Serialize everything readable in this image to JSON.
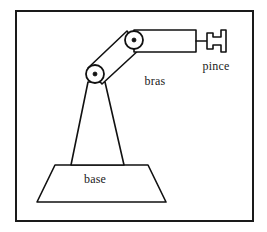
{
  "figure": {
    "background_color": "#ffffff",
    "stroke_color": "#111111",
    "frame": {
      "name": "figure-border",
      "x": 16,
      "y": 11,
      "width": 237,
      "height": 210,
      "stroke_color": "#1a1a1a",
      "stroke_width": 2
    }
  },
  "labels": {
    "base": "base",
    "arm": "bras",
    "gripper": "pince"
  },
  "label_positions": {
    "base": {
      "x": 95,
      "y": 183
    },
    "arm": {
      "x": 155,
      "y": 85
    },
    "gripper": {
      "x": 216,
      "y": 70
    }
  },
  "parts": {
    "base": {
      "name": "robot-base",
      "shape": "trapezoid",
      "points": "55,165 148,165 166,202 37,202"
    },
    "column": {
      "name": "robot-column",
      "shape": "tapered-column",
      "points": "88,82 105,82 124,165 71,165"
    },
    "upper_arm": {
      "name": "robot-upper-arm",
      "shape": "parallelogram-link",
      "points": "88,68 127,31 141,48 102,84"
    },
    "forearm": {
      "name": "robot-forearm",
      "shape": "rectangle-link",
      "points": "134,30 196,30 196,52 134,52"
    },
    "gripper_stem": {
      "name": "gripper-stem",
      "shape": "line",
      "x1": 196,
      "y1": 41,
      "x2": 207,
      "y2": 41
    },
    "gripper_jaw": {
      "name": "gripper-jaw",
      "shape": "c-bracket",
      "points": "207,33 207,49 213,49 213,45 221,45 221,52 226,52 226,30 221,30 221,37 213,37 213,33"
    }
  },
  "joints": [
    {
      "name": "shoulder-joint",
      "cx": 95,
      "cy": 74,
      "radius": 9,
      "hub_radius": 2
    },
    {
      "name": "elbow-joint",
      "cx": 134,
      "cy": 40,
      "radius": 9,
      "hub_radius": 2
    }
  ]
}
